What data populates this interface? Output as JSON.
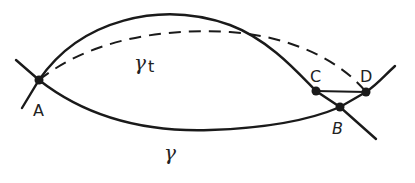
{
  "diagram": {
    "points": {
      "A": {
        "label": "A",
        "x": 39,
        "y": 80
      },
      "B": {
        "label": "B",
        "x": 340,
        "y": 107
      },
      "C": {
        "label": "C",
        "x": 316,
        "y": 91
      },
      "D": {
        "label": "D",
        "x": 366,
        "y": 92
      }
    },
    "curves": {
      "gamma": {
        "label": "γ"
      },
      "gamma_t": {
        "label": "γ",
        "subscript": "t"
      }
    },
    "colors": {
      "ink": "#1a1a1a",
      "background": "#ffffff"
    }
  }
}
